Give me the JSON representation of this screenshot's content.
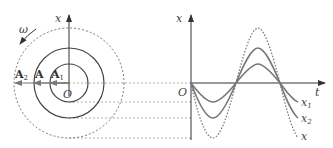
{
  "phasor": {
    "origin_label": "O",
    "axis_label": "x",
    "rotation_label": "ω",
    "vectors": [
      {
        "label": "A",
        "sub": "2",
        "name": "A2"
      },
      {
        "label": "A",
        "sub": "",
        "name": "A"
      },
      {
        "label": "A",
        "sub": "1",
        "name": "A1"
      }
    ]
  },
  "graph": {
    "origin_label": "O",
    "y_axis_label": "x",
    "x_axis_label": "t",
    "curves": [
      {
        "label": "x",
        "sub": "1",
        "amplitude": 19,
        "style": "solid"
      },
      {
        "label": "x",
        "sub": "2",
        "amplitude": 35,
        "style": "solid"
      },
      {
        "label": "x",
        "sub": "",
        "amplitude": 55,
        "style": "dotted"
      }
    ]
  },
  "colors": {
    "line": "#555555",
    "curve": "#777777",
    "dashed": "#888888"
  }
}
